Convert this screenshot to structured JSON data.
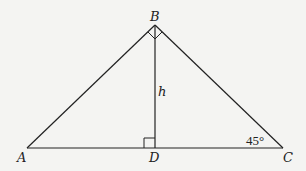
{
  "diagram": {
    "type": "right-triangle-with-altitude",
    "vertices": {
      "A": {
        "label": "A",
        "x": 27,
        "y": 148
      },
      "B": {
        "label": "B",
        "x": 155,
        "y": 25
      },
      "C": {
        "label": "C",
        "x": 283,
        "y": 148
      },
      "D": {
        "label": "D",
        "x": 155,
        "y": 148
      }
    },
    "altitude_label": "h",
    "angle_C_label": "45°",
    "right_angles": [
      "ABC",
      "BDA"
    ],
    "colors": {
      "line": "#222222",
      "background": "#f4f4f2"
    }
  }
}
